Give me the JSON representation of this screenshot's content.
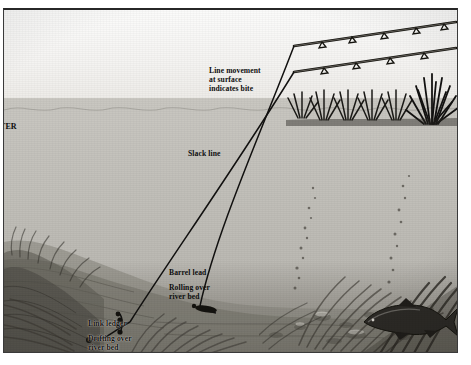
{
  "figure": {
    "kind": "angling-technique-illustration",
    "scene": "underwater cross-section of a river with two rods on the far bank"
  },
  "labels": {
    "water_edge": "TER",
    "bite_indication": "Line movement\nat surface\nindicates bite",
    "slack_line": "Slack line",
    "barrel_lead": "Barrel lead",
    "barrel_lead_detail": "Rolling over\nriver bed",
    "link_ledger": "Link ledger",
    "link_ledger_detail": "Drifting over\nriver bed"
  },
  "elements": {
    "rod_upper": "fishing-rod-upper",
    "rod_lower": "fishing-rod-lower",
    "rod_rings": 9,
    "bank_vegetation": "reeds-far-bank",
    "weed_beds": "streamer-weed",
    "fish": "barbel",
    "bubbles": "bubble-trail",
    "gravel": "gravel-river-bed"
  },
  "colors": {
    "sky": "#f6f5f3",
    "water": "#c3c1bb",
    "bed": "#8c8982",
    "ink": "#161616",
    "frame": "#272727"
  }
}
